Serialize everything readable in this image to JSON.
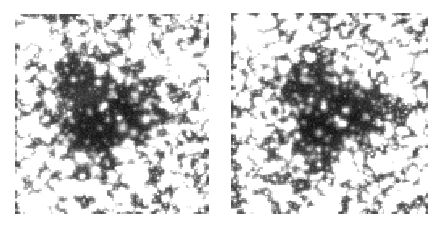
{
  "figure": {
    "title": "",
    "background_color": "#ffffff",
    "width": 445,
    "height": 228,
    "panel_count": 2
  },
  "chart_data": {
    "type": "heatmap",
    "title": "",
    "subtitle": "",
    "xlabel": "",
    "ylabel": "",
    "colormap": "grayscale",
    "value_range": [
      0,
      255
    ],
    "panels": [
      {
        "id": "panel-left",
        "label": "",
        "x_px": 15,
        "y_px": 14,
        "width_px": 194,
        "height_px": 200,
        "background_level": 72,
        "dark_cloud": {
          "center_x_frac": 0.45,
          "center_y_frac": 0.5,
          "radius_x_frac": 0.34,
          "radius_y_frac": 0.33,
          "rotation_deg": -12,
          "depth": 0.55
        },
        "diffuse_wisp": {
          "center_x_frac": 0.38,
          "center_y_frac": 0.4,
          "radius_x_frac": 0.13,
          "radius_y_frac": 0.055,
          "rotation_deg": -18,
          "brightness": 0.34
        },
        "star_density": 1.0,
        "seed": 1337,
        "bright_stars": [
          {
            "x": 0.08,
            "y": 0.08,
            "r": 7.5,
            "i": 1.0
          },
          {
            "x": 0.14,
            "y": 0.12,
            "r": 4.5,
            "i": 0.95
          },
          {
            "x": 0.045,
            "y": 0.125,
            "r": 3.2,
            "i": 0.85
          },
          {
            "x": 0.3,
            "y": 0.055,
            "r": 3.0,
            "i": 0.88
          },
          {
            "x": 0.395,
            "y": 0.105,
            "r": 3.4,
            "i": 0.92
          },
          {
            "x": 0.79,
            "y": 0.12,
            "r": 4.2,
            "i": 0.95
          },
          {
            "x": 0.875,
            "y": 0.25,
            "r": 7.2,
            "i": 1.0
          },
          {
            "x": 0.63,
            "y": 0.175,
            "r": 3.0,
            "i": 0.86
          },
          {
            "x": 0.56,
            "y": 0.135,
            "r": 2.8,
            "i": 0.84
          },
          {
            "x": 0.69,
            "y": 0.235,
            "r": 4.0,
            "i": 0.93
          },
          {
            "x": 0.165,
            "y": 0.215,
            "r": 3.8,
            "i": 0.92
          },
          {
            "x": 0.23,
            "y": 0.175,
            "r": 2.8,
            "i": 0.82
          },
          {
            "x": 0.03,
            "y": 0.305,
            "r": 3.4,
            "i": 0.88
          },
          {
            "x": 0.055,
            "y": 0.425,
            "r": 2.8,
            "i": 0.82
          },
          {
            "x": 0.06,
            "y": 0.545,
            "r": 3.6,
            "i": 0.9
          },
          {
            "x": 0.135,
            "y": 0.7,
            "r": 4.6,
            "i": 0.96
          },
          {
            "x": 0.205,
            "y": 0.755,
            "r": 3.2,
            "i": 0.86
          },
          {
            "x": 0.335,
            "y": 0.72,
            "r": 4.0,
            "i": 0.93
          },
          {
            "x": 0.565,
            "y": 0.705,
            "r": 4.4,
            "i": 0.95
          },
          {
            "x": 0.605,
            "y": 0.79,
            "r": 5.0,
            "i": 0.97
          },
          {
            "x": 0.74,
            "y": 0.63,
            "r": 3.2,
            "i": 0.86
          },
          {
            "x": 0.8,
            "y": 0.565,
            "r": 3.0,
            "i": 0.84
          },
          {
            "x": 0.875,
            "y": 0.735,
            "r": 3.0,
            "i": 0.84
          },
          {
            "x": 0.245,
            "y": 0.875,
            "r": 3.6,
            "i": 0.9
          },
          {
            "x": 0.125,
            "y": 0.965,
            "r": 6.0,
            "i": 1.0
          },
          {
            "x": 0.44,
            "y": 0.935,
            "r": 3.0,
            "i": 0.85
          },
          {
            "x": 0.675,
            "y": 0.905,
            "r": 3.0,
            "i": 0.85
          },
          {
            "x": 0.905,
            "y": 0.905,
            "r": 2.8,
            "i": 0.82
          },
          {
            "x": 0.46,
            "y": 0.455,
            "r": 2.4,
            "i": 0.76
          },
          {
            "x": 0.53,
            "y": 0.515,
            "r": 2.2,
            "i": 0.72
          }
        ]
      },
      {
        "id": "panel-right",
        "label": "",
        "x_px": 231,
        "y_px": 13,
        "width_px": 197,
        "height_px": 201,
        "background_level": 70,
        "dark_cloud": {
          "center_x_frac": 0.47,
          "center_y_frac": 0.5,
          "radius_x_frac": 0.33,
          "radius_y_frac": 0.32,
          "rotation_deg": -10,
          "depth": 0.58
        },
        "diffuse_wisp": {
          "center_x_frac": 0.4,
          "center_y_frac": 0.42,
          "radius_x_frac": 0.11,
          "radius_y_frac": 0.05,
          "rotation_deg": -15,
          "brightness": 0.28
        },
        "star_density": 1.05,
        "seed": 2024,
        "bright_stars": [
          {
            "x": 0.085,
            "y": 0.085,
            "r": 7.0,
            "i": 1.0
          },
          {
            "x": 0.145,
            "y": 0.125,
            "r": 4.2,
            "i": 0.94
          },
          {
            "x": 0.05,
            "y": 0.13,
            "r": 3.0,
            "i": 0.84
          },
          {
            "x": 0.305,
            "y": 0.06,
            "r": 3.0,
            "i": 0.87
          },
          {
            "x": 0.4,
            "y": 0.11,
            "r": 3.2,
            "i": 0.9
          },
          {
            "x": 0.78,
            "y": 0.115,
            "r": 4.0,
            "i": 0.94
          },
          {
            "x": 0.865,
            "y": 0.245,
            "r": 7.0,
            "i": 1.0
          },
          {
            "x": 0.635,
            "y": 0.18,
            "r": 3.0,
            "i": 0.86
          },
          {
            "x": 0.555,
            "y": 0.14,
            "r": 2.8,
            "i": 0.84
          },
          {
            "x": 0.695,
            "y": 0.24,
            "r": 3.8,
            "i": 0.92
          },
          {
            "x": 0.17,
            "y": 0.22,
            "r": 3.6,
            "i": 0.91
          },
          {
            "x": 0.235,
            "y": 0.18,
            "r": 2.8,
            "i": 0.82
          },
          {
            "x": 0.035,
            "y": 0.31,
            "r": 3.2,
            "i": 0.87
          },
          {
            "x": 0.06,
            "y": 0.43,
            "r": 2.8,
            "i": 0.82
          },
          {
            "x": 0.065,
            "y": 0.55,
            "r": 3.4,
            "i": 0.89
          },
          {
            "x": 0.14,
            "y": 0.705,
            "r": 4.4,
            "i": 0.95
          },
          {
            "x": 0.21,
            "y": 0.76,
            "r": 3.0,
            "i": 0.85
          },
          {
            "x": 0.34,
            "y": 0.725,
            "r": 3.8,
            "i": 0.92
          },
          {
            "x": 0.57,
            "y": 0.71,
            "r": 4.2,
            "i": 0.94
          },
          {
            "x": 0.61,
            "y": 0.795,
            "r": 4.8,
            "i": 0.96
          },
          {
            "x": 0.745,
            "y": 0.635,
            "r": 3.0,
            "i": 0.85
          },
          {
            "x": 0.805,
            "y": 0.57,
            "r": 2.8,
            "i": 0.83
          },
          {
            "x": 0.88,
            "y": 0.74,
            "r": 2.8,
            "i": 0.83
          },
          {
            "x": 0.25,
            "y": 0.88,
            "r": 3.4,
            "i": 0.89
          },
          {
            "x": 0.13,
            "y": 0.965,
            "r": 5.6,
            "i": 1.0
          },
          {
            "x": 0.445,
            "y": 0.94,
            "r": 2.8,
            "i": 0.84
          },
          {
            "x": 0.68,
            "y": 0.91,
            "r": 2.8,
            "i": 0.84
          },
          {
            "x": 0.91,
            "y": 0.91,
            "r": 2.6,
            "i": 0.81
          },
          {
            "x": 0.465,
            "y": 0.46,
            "r": 2.2,
            "i": 0.74
          },
          {
            "x": 0.535,
            "y": 0.52,
            "r": 2.0,
            "i": 0.7
          }
        ]
      }
    ]
  }
}
